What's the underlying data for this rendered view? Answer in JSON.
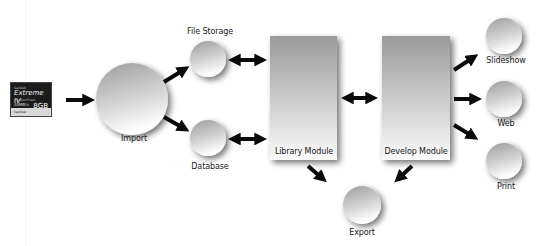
{
  "diagram": {
    "type": "workflow",
    "source": {
      "label": "",
      "card": {
        "brand_small": "SanDisk",
        "brand": "Extreme IV",
        "subtitle": "CompactFlash",
        "speed": "40MB/s",
        "capacity": "8GB",
        "stripe": "SanDisk"
      }
    },
    "nodes": [
      {
        "id": "import",
        "label": "Import",
        "shape": "circle",
        "cx": 132,
        "cy": 99,
        "r": 36,
        "label_x": 134,
        "label_y": 141
      },
      {
        "id": "file_storage",
        "label": "File Storage",
        "shape": "circle",
        "cx": 208,
        "cy": 59,
        "r": 18,
        "label_x": 210,
        "label_y": 28
      },
      {
        "id": "database",
        "label": "Database",
        "shape": "circle",
        "cx": 208,
        "cy": 138,
        "r": 18,
        "label_x": 210,
        "label_y": 163
      },
      {
        "id": "library_module",
        "label": "Library Module",
        "shape": "rect",
        "x": 270,
        "y": 36,
        "w": 67,
        "h": 124,
        "label_x": 304,
        "label_y": 148
      },
      {
        "id": "develop_module",
        "label": "Develop Module",
        "shape": "rect",
        "x": 382,
        "y": 36,
        "w": 68,
        "h": 124,
        "label_x": 416,
        "label_y": 148
      },
      {
        "id": "export",
        "label": "Export",
        "shape": "circle",
        "cx": 362,
        "cy": 205,
        "r": 19,
        "label_x": 362,
        "label_y": 228
      },
      {
        "id": "slideshow",
        "label": "Slideshow",
        "shape": "circle",
        "cx": 504,
        "cy": 36,
        "r": 18,
        "label_x": 506,
        "label_y": 57
      },
      {
        "id": "web",
        "label": "Web",
        "shape": "circle",
        "cx": 504,
        "cy": 99,
        "r": 18,
        "label_x": 506,
        "label_y": 120
      },
      {
        "id": "print",
        "label": "Print",
        "shape": "circle",
        "cx": 504,
        "cy": 161,
        "r": 18,
        "label_x": 506,
        "label_y": 183
      }
    ],
    "edges": [
      {
        "from": "card",
        "to": "import",
        "direction": "forward"
      },
      {
        "from": "import",
        "to": "file_storage",
        "direction": "forward"
      },
      {
        "from": "import",
        "to": "database",
        "direction": "forward"
      },
      {
        "from": "file_storage",
        "to": "library_module",
        "direction": "both"
      },
      {
        "from": "database",
        "to": "library_module",
        "direction": "both"
      },
      {
        "from": "library_module",
        "to": "develop_module",
        "direction": "both"
      },
      {
        "from": "library_module",
        "to": "export",
        "direction": "forward"
      },
      {
        "from": "develop_module",
        "to": "export",
        "direction": "forward"
      },
      {
        "from": "develop_module",
        "to": "slideshow",
        "direction": "forward"
      },
      {
        "from": "develop_module",
        "to": "web",
        "direction": "forward"
      },
      {
        "from": "develop_module",
        "to": "print",
        "direction": "forward"
      }
    ],
    "colors": {
      "arrow": "#0a0a0a",
      "shape_dark": "#9a9a9a",
      "shape_light": "#fafafa",
      "shadow": "#888888",
      "label": "#1a1a1a"
    }
  }
}
